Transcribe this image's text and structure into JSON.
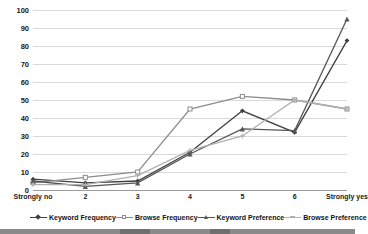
{
  "chart_data": {
    "type": "line",
    "title": "",
    "xlabel": "",
    "ylabel": "",
    "ylim": [
      0,
      100
    ],
    "ytick_step": 10,
    "grid": true,
    "legend_position": "bottom",
    "categories": [
      "Strongly no",
      "2",
      "3",
      "4",
      "5",
      "6",
      "Strongly yes"
    ],
    "yticks": [
      "0",
      "10",
      "20",
      "30",
      "40",
      "50",
      "60",
      "70",
      "80",
      "90",
      "100"
    ],
    "series": [
      {
        "name": "Keyword Frequency",
        "color": "#3f3f3f",
        "marker": "diamond",
        "values": [
          6,
          4,
          5,
          21,
          44,
          32,
          83
        ]
      },
      {
        "name": "Browse Frequency",
        "color": "#8c8c8c",
        "marker": "square",
        "values": [
          4,
          7,
          10,
          45,
          52,
          50,
          45
        ]
      },
      {
        "name": "Keyword Preference",
        "color": "#565656",
        "marker": "triangle",
        "values": [
          5,
          2,
          4,
          20,
          34,
          33,
          95
        ]
      },
      {
        "name": "Browse Preference",
        "color": "#b0b0b0",
        "marker": "cross",
        "values": [
          3,
          3,
          8,
          22,
          30,
          50,
          45
        ]
      }
    ]
  },
  "legend": {
    "items": [
      {
        "label": "Keyword Frequency"
      },
      {
        "label": "Browse Frequency"
      },
      {
        "label": "Keyword Preference"
      },
      {
        "label": "Browse Preference"
      }
    ]
  }
}
